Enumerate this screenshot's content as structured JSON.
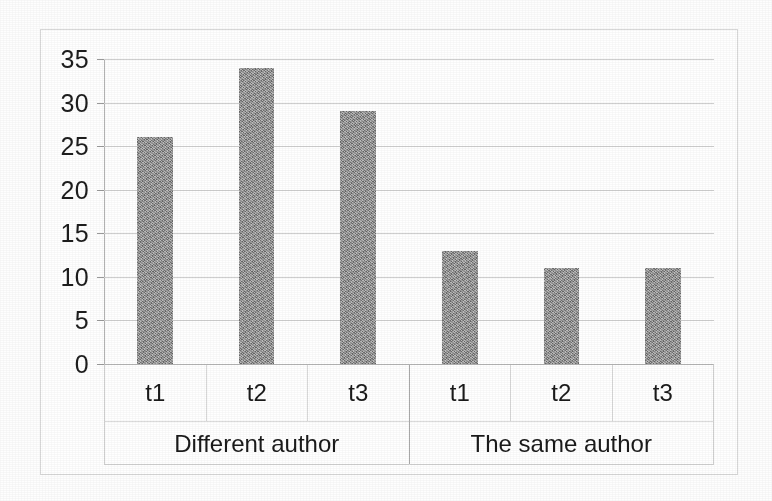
{
  "chart_data": {
    "type": "bar",
    "title": "",
    "subtitle": "",
    "xlabel": "",
    "ylabel": "",
    "categories": [
      "t1",
      "t2",
      "t3",
      "t1",
      "t2",
      "t3"
    ],
    "values": [
      26,
      34,
      29,
      13,
      11,
      11
    ],
    "groups": [
      {
        "label": "Different author",
        "categories": [
          "t1",
          "t2",
          "t3"
        ],
        "values": [
          26,
          34,
          29
        ]
      },
      {
        "label": "The same author",
        "categories": [
          "t1",
          "t2",
          "t3"
        ],
        "values": [
          13,
          11,
          11
        ]
      }
    ],
    "ylim": [
      0,
      35
    ],
    "ytick_step": 5,
    "yticks": [
      35,
      30,
      25,
      20,
      15,
      10,
      5,
      0
    ],
    "grid": true,
    "legend": false,
    "legend_position": "none",
    "bar_color": "#878787",
    "gridline_color": "#cfcfcf",
    "axis_color": "#b4b4b4",
    "text_color": "#1a1a1a",
    "frame_color": "#d8d8d8",
    "background": "#ffffff"
  },
  "axis": {
    "y_tick_labels": [
      "35",
      "30",
      "25",
      "20",
      "15",
      "10",
      "5",
      "0"
    ]
  },
  "x_labels": [
    "t1",
    "t2",
    "t3",
    "t1",
    "t2",
    "t3"
  ],
  "group_labels": [
    "Different author",
    "The same author"
  ]
}
